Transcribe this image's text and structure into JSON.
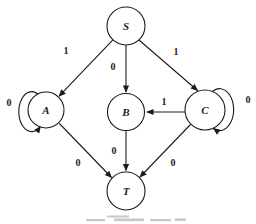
{
  "figure": {
    "type": "state-transition-diagram",
    "background_color": "#ffffff",
    "ink_color": "#1b1b1b",
    "nodes": {
      "S": {
        "label": "S"
      },
      "A": {
        "label": "A"
      },
      "B": {
        "label": "B"
      },
      "C": {
        "label": "C"
      },
      "T": {
        "label": "T"
      }
    },
    "edges": [
      {
        "from": "S",
        "to": "A",
        "label": "1"
      },
      {
        "from": "S",
        "to": "B",
        "label": "0"
      },
      {
        "from": "S",
        "to": "C",
        "label": "1"
      },
      {
        "from": "C",
        "to": "B",
        "label": "1"
      },
      {
        "from": "A",
        "to": "A",
        "label": "0",
        "type": "self-loop"
      },
      {
        "from": "C",
        "to": "C",
        "label": "0",
        "type": "self-loop"
      },
      {
        "from": "A",
        "to": "T",
        "label": "0"
      },
      {
        "from": "B",
        "to": "T",
        "label": "0"
      },
      {
        "from": "C",
        "to": "T",
        "label": "0"
      }
    ]
  }
}
